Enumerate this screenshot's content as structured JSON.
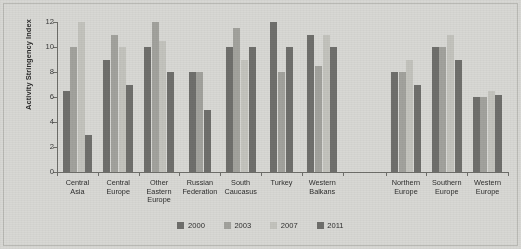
{
  "chart_data": {
    "type": "bar",
    "title": "",
    "subtitle": "",
    "xlabel": "",
    "ylabel": "Activity Stringency Index",
    "ylim": [
      0,
      12
    ],
    "yticks": [
      0,
      2,
      4,
      6,
      8,
      10,
      12
    ],
    "ytick_labels": [
      "0",
      "2",
      "4",
      "6",
      "8",
      "10",
      "12"
    ],
    "grid": false,
    "legend_position": "bottom-center",
    "categories": [
      "Central\nAsia",
      "Central\nEurope",
      "Other\nEastern\nEurope",
      "Russian\nFederation",
      "South\nCaucasus",
      "Turkey",
      "Western\nBalkans",
      "Northern\nEurope",
      "Southern\nEurope",
      "Western\nEurope"
    ],
    "group_gap_after_index": 6,
    "series": [
      {
        "name": "2000",
        "color": "#6f6f6c",
        "values": [
          6.5,
          9.0,
          10.0,
          8.0,
          10.0,
          12.0,
          11.0,
          8.0,
          10.0,
          6.0
        ]
      },
      {
        "name": "2003",
        "color": "#a2a29d",
        "values": [
          10.0,
          11.0,
          12.0,
          8.0,
          11.5,
          8.0,
          8.5,
          8.0,
          10.0,
          6.0
        ]
      },
      {
        "name": "2007",
        "color": "#c3c3bd",
        "values": [
          12.0,
          10.0,
          10.5,
          null,
          9.0,
          null,
          11.0,
          9.0,
          11.0,
          6.5
        ]
      },
      {
        "name": "2011",
        "color": "#6f6f6c",
        "values": [
          3.0,
          7.0,
          8.0,
          5.0,
          10.0,
          10.0,
          10.0,
          7.0,
          9.0,
          6.2
        ]
      }
    ]
  },
  "legend": {
    "items": [
      {
        "label": "2000",
        "color": "#6f6f6c"
      },
      {
        "label": "2003",
        "color": "#a2a29d"
      },
      {
        "label": "2007",
        "color": "#c3c3bd"
      },
      {
        "label": "2011",
        "color": "#6f6f6c"
      }
    ]
  },
  "colors": {
    "background": "#d8d8d4",
    "axis": "#6e6e6a",
    "text": "#2e2e2e"
  }
}
